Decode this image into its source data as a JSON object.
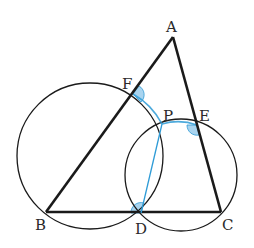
{
  "diagram": {
    "colors": {
      "line": "#1a1a1a",
      "accent": "#2e9bd6",
      "angle_fill": "#a9d4ef"
    },
    "points": {
      "A": {
        "label": "A",
        "x": 173,
        "y": 37,
        "lx": 166,
        "ly": 32
      },
      "F": {
        "label": "F",
        "x": 133,
        "y": 94,
        "lx": 122,
        "ly": 88
      },
      "P": {
        "label": "P",
        "x": 162,
        "y": 124,
        "lx": 163,
        "ly": 120
      },
      "E": {
        "label": "E",
        "x": 197,
        "y": 125,
        "lx": 198,
        "ly": 120
      },
      "B": {
        "label": "B",
        "x": 46,
        "y": 212,
        "lx": 35,
        "ly": 230
      },
      "D": {
        "label": "D",
        "x": 141,
        "y": 213,
        "lx": 135,
        "ly": 233
      },
      "C": {
        "label": "C",
        "x": 221,
        "y": 212,
        "lx": 221,
        "ly": 230
      }
    },
    "segments": [
      "AB",
      "AC",
      "BC",
      "PD"
    ],
    "circles": [
      {
        "name": "circle-BDPF",
        "cx": 90,
        "cy": 156,
        "r": 73
      },
      {
        "name": "circle-DCEP",
        "cx": 181,
        "cy": 175,
        "r": 56
      }
    ],
    "highlighted": [
      "segment-PD",
      "arc-FP",
      "arc-PE",
      "angle-F",
      "angle-E",
      "angle-D"
    ]
  }
}
